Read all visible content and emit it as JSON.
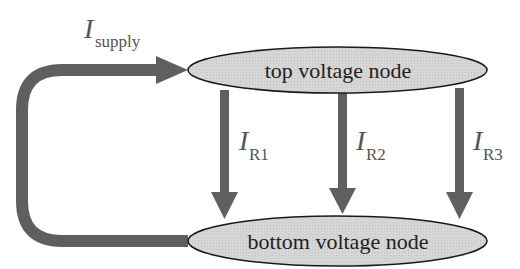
{
  "diagram": {
    "nodes": {
      "top": {
        "label": "top voltage node"
      },
      "bottom": {
        "label": "bottom voltage node"
      }
    },
    "currents": {
      "supply": {
        "symbol": "I",
        "subscript": "supply"
      },
      "r1": {
        "symbol": "I",
        "subscript": "R1"
      },
      "r2": {
        "symbol": "I",
        "subscript": "R2"
      },
      "r3": {
        "symbol": "I",
        "subscript": "R3"
      }
    },
    "colors": {
      "arrow": "#5f5f5f",
      "node_fill": "#d4d4d4",
      "node_stroke": "#1a1a1a",
      "text": "#222222",
      "current_label": "#555555"
    }
  }
}
